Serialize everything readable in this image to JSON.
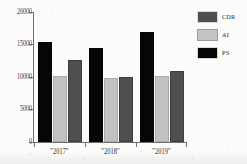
{
  "chart_data": {
    "type": "bar",
    "title": "",
    "subtitle": "",
    "xlabel": "",
    "ylabel": "",
    "categories": [
      "\"2017\"",
      "\"2018\"",
      "\"2019\""
    ],
    "series": [
      {
        "name": "PS",
        "color": "#060606",
        "values": [
          15450,
          14500,
          16900
        ]
      },
      {
        "name": "AI",
        "color": "#c2c2c2",
        "values": [
          10200,
          9900,
          10100
        ]
      },
      {
        "name": "CDR",
        "color": "#4f4f4f",
        "values": [
          12600,
          10000,
          11000
        ]
      }
    ],
    "ylim": [
      0,
      20000
    ],
    "yticks": [
      0,
      5000,
      10000,
      15000,
      20000
    ],
    "ytick_labels": [
      "0",
      "5000",
      "10000",
      "15000",
      "20000"
    ],
    "grid": false,
    "legend_position": "right",
    "bar_order_in_group": [
      "PS",
      "AI",
      "CDR"
    ]
  },
  "legend": {
    "entries": [
      {
        "label": "CDR",
        "swatch": "cdr"
      },
      {
        "label": "AI",
        "swatch": "ai"
      },
      {
        "label": "PS",
        "swatch": "ps"
      }
    ]
  },
  "axes": {
    "y_tick_labels": [
      "20000",
      "15000",
      "10000",
      "5000",
      "0"
    ],
    "x_tick_labels": [
      "\"2017\"",
      "\"2018\"",
      "\"2019\""
    ]
  }
}
